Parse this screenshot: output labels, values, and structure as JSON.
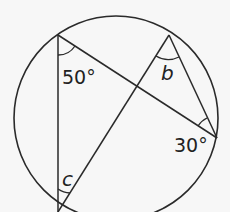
{
  "diagram": {
    "type": "circle-theorem",
    "circle": {
      "cx": 116,
      "cy": 118,
      "r": 102
    },
    "points": {
      "A": {
        "x": 58,
        "y": 35
      },
      "B": {
        "x": 169,
        "y": 35
      },
      "D": {
        "x": 217,
        "y": 138
      },
      "C": {
        "x": 58,
        "y": 212
      }
    },
    "chords": [
      {
        "from": "A",
        "to": "C"
      },
      {
        "from": "A",
        "to": "D"
      },
      {
        "from": "B",
        "to": "C"
      },
      {
        "from": "B",
        "to": "D"
      }
    ],
    "angles": [
      {
        "vertex": "A",
        "label": "50°"
      },
      {
        "vertex": "B",
        "label": "b"
      },
      {
        "vertex": "D",
        "label": "30°"
      },
      {
        "vertex": "C",
        "label": "c"
      }
    ]
  },
  "labels": {
    "angle_a": "50°",
    "angle_b": "b",
    "angle_d": "30°",
    "angle_c": "c"
  },
  "colors": {
    "stroke": "#2a2a2a",
    "background": "#f7f7f7"
  }
}
